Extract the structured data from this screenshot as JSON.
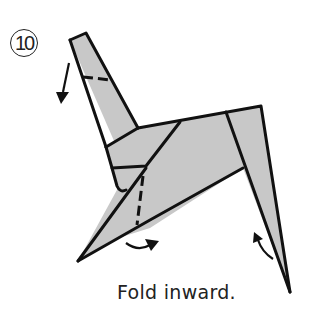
{
  "step": {
    "number": "10"
  },
  "caption": {
    "text": "Fold inward."
  },
  "colors": {
    "paper": "#c8c8c8",
    "line": "#111111",
    "background": "#ffffff"
  },
  "annotations": [
    {
      "name": "arrow-head-fold-down",
      "direction": "down"
    },
    {
      "name": "arrow-front-leg-fold-inward",
      "direction": "right"
    },
    {
      "name": "arrow-back-leg-fold-inward",
      "direction": "up-left"
    }
  ]
}
